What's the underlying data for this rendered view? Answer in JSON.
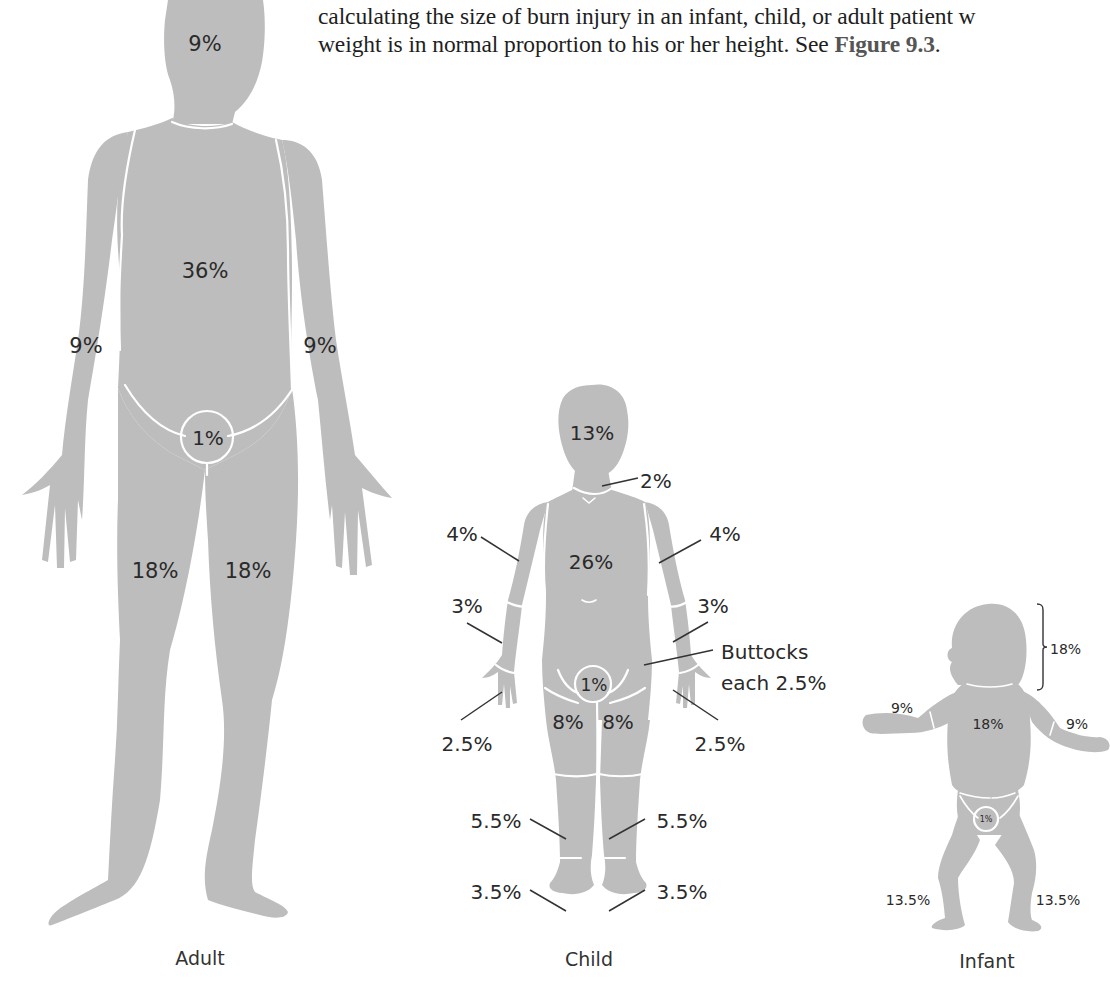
{
  "body_text": {
    "line1": "calculating the size of burn injury in an infant, child, or adult patient w",
    "line2_prefix": "weight is in normal proportion to his or her height. See ",
    "line2_ref": "Figure 9.3",
    "line2_suffix": "."
  },
  "figures": {
    "adult": {
      "caption": "Adult",
      "head": "9%",
      "torso": "36%",
      "left_arm": "9%",
      "right_arm": "9%",
      "genitals": "1%",
      "left_leg": "18%",
      "right_leg": "18%"
    },
    "child": {
      "caption": "Child",
      "head": "13%",
      "neck": "2%",
      "torso": "26%",
      "left_upper_arm": "4%",
      "right_upper_arm": "4%",
      "left_forearm": "3%",
      "right_forearm": "3%",
      "buttocks_line1": "Buttocks",
      "buttocks_line2": "each 2.5%",
      "genitals": "1%",
      "left_hand": "2.5%",
      "right_hand": "2.5%",
      "left_thigh": "8%",
      "right_thigh": "8%",
      "left_lower_leg": "5.5%",
      "right_lower_leg": "5.5%",
      "left_foot": "3.5%",
      "right_foot": "3.5%"
    },
    "infant": {
      "caption": "Infant",
      "head": "18%",
      "torso": "18%",
      "left_arm": "9%",
      "right_arm": "9%",
      "genitals": "1%",
      "left_leg": "13.5%",
      "right_leg": "13.5%"
    }
  },
  "colors": {
    "silhouette": "#bdbdbd",
    "seam": "#ffffff",
    "label": "#2a2a2a"
  }
}
